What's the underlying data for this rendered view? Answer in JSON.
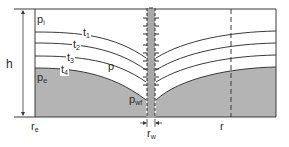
{
  "diagram": {
    "labels": {
      "pi": {
        "main": "p",
        "sub": "i"
      },
      "t1": {
        "main": "t",
        "sub": "1"
      },
      "t2": {
        "main": "t",
        "sub": "2"
      },
      "t3": {
        "main": "t",
        "sub": "3"
      },
      "t4": {
        "main": "t",
        "sub": "4"
      },
      "p": {
        "main": "p",
        "sub": ""
      },
      "pe": {
        "main": "p",
        "sub": "e"
      },
      "pwf": {
        "main": "p",
        "sub": "wf"
      },
      "h": {
        "main": "h",
        "sub": ""
      },
      "re": {
        "main": "r",
        "sub": "e"
      },
      "rw": {
        "main": "r",
        "sub": "w"
      },
      "r": {
        "main": "r",
        "sub": ""
      }
    },
    "colors": {
      "shaded": "#b4b4b4",
      "line": "#3a3a3a",
      "wellbore": "#a8a8a8"
    }
  }
}
